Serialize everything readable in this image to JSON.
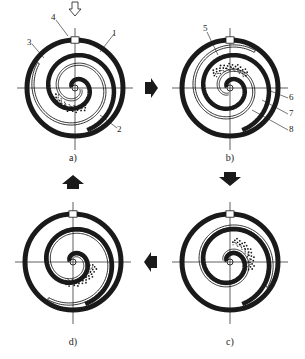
{
  "figure": {
    "panels": [
      {
        "id": "a",
        "caption": "a)",
        "cx": 75,
        "cy": 88,
        "rotation": 0,
        "pocket_angle": 110
      },
      {
        "id": "b",
        "caption": "b)",
        "cx": 230,
        "cy": 88,
        "rotation": 90,
        "pocket_angle": 270
      },
      {
        "id": "c",
        "caption": "c)",
        "cx": 230,
        "cy": 262,
        "rotation": 180,
        "pocket_angle": 330
      },
      {
        "id": "d",
        "caption": "d)",
        "cx": 73,
        "cy": 262,
        "rotation": 270,
        "pocket_angle": 60
      }
    ],
    "labels": [
      {
        "text": "4",
        "x": 51,
        "y": 16
      },
      {
        "text": "1",
        "x": 112,
        "y": 32
      },
      {
        "text": "3",
        "x": 27,
        "y": 41
      },
      {
        "text": "2",
        "x": 117,
        "y": 128
      },
      {
        "text": "5",
        "x": 203,
        "y": 27
      },
      {
        "text": "6",
        "x": 289,
        "y": 96
      },
      {
        "text": "7",
        "x": 289,
        "y": 112
      },
      {
        "text": "8",
        "x": 289,
        "y": 128
      }
    ],
    "flow_arrows": [
      {
        "direction": "right",
        "from": "a",
        "to": "b"
      },
      {
        "direction": "down",
        "from": "b",
        "to": "c"
      },
      {
        "direction": "left",
        "from": "c",
        "to": "d"
      },
      {
        "direction": "up",
        "from": "d",
        "to": "a"
      }
    ],
    "inlet_arrow": {
      "panel": "a",
      "direction": "down"
    },
    "colors": {
      "ink": "#1a1a1a",
      "background": "#ffffff"
    }
  }
}
